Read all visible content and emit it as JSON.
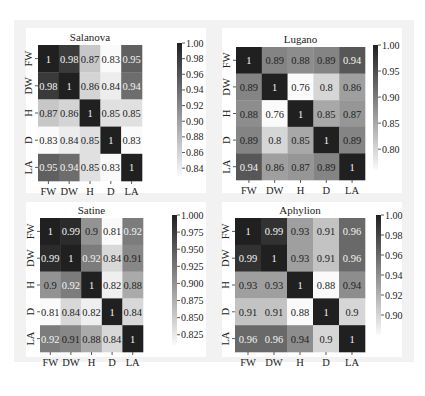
{
  "chart_data": [
    {
      "type": "heatmap",
      "title": "Salanova",
      "labels": [
        "FW",
        "DW",
        "H",
        "D",
        "LA"
      ],
      "values": [
        [
          1,
          0.98,
          0.87,
          0.83,
          0.95
        ],
        [
          0.98,
          1,
          0.86,
          0.84,
          0.94
        ],
        [
          0.87,
          0.86,
          1,
          0.85,
          0.85
        ],
        [
          0.83,
          0.84,
          0.85,
          1,
          0.83
        ],
        [
          0.95,
          0.94,
          0.85,
          0.83,
          1
        ]
      ],
      "cell_labels": [
        [
          "1",
          "0.98",
          "0.87",
          "0.83",
          "0.95"
        ],
        [
          "0.98",
          "1",
          "0.86",
          "0.84",
          "0.94"
        ],
        [
          "0.87",
          "0.86",
          "1",
          "0.85",
          "0.85"
        ],
        [
          "0.83",
          "0.84",
          "0.85",
          "1",
          "0.83"
        ],
        [
          "0.95",
          "0.94",
          "0.85",
          "0.83",
          "1"
        ]
      ],
      "colorbar": {
        "range": [
          0.83,
          1.0
        ],
        "ticks": [
          1.0,
          0.98,
          0.96,
          0.94,
          0.92,
          0.9,
          0.88,
          0.86,
          0.84
        ],
        "tick_labels": [
          "1.00",
          "0.98",
          "0.96",
          "0.94",
          "0.92",
          "0.90",
          "0.88",
          "0.86",
          "0.84"
        ]
      },
      "colormap": "grey (light = low, dark = high)"
    },
    {
      "type": "heatmap",
      "title": "Lugano",
      "labels": [
        "FW",
        "DW",
        "H",
        "D",
        "LA"
      ],
      "values": [
        [
          1,
          0.89,
          0.88,
          0.89,
          0.94
        ],
        [
          0.89,
          1,
          0.76,
          0.8,
          0.86
        ],
        [
          0.88,
          0.76,
          1,
          0.85,
          0.87
        ],
        [
          0.89,
          0.8,
          0.85,
          1,
          0.89
        ],
        [
          0.94,
          0.86,
          0.87,
          0.89,
          1
        ]
      ],
      "cell_labels": [
        [
          "1",
          "0.89",
          "0.88",
          "0.89",
          "0.94"
        ],
        [
          "0.89",
          "1",
          "0.76",
          "0.8",
          "0.86"
        ],
        [
          "0.88",
          "0.76",
          "1",
          "0.85",
          "0.87"
        ],
        [
          "0.89",
          "0.8",
          "0.85",
          "1",
          "0.89"
        ],
        [
          "0.94",
          "0.86",
          "0.87",
          "0.89",
          "1"
        ]
      ],
      "colorbar": {
        "range": [
          0.76,
          1.0
        ],
        "ticks": [
          1.0,
          0.95,
          0.9,
          0.85,
          0.8
        ],
        "tick_labels": [
          "1.00",
          "0.95",
          "0.90",
          "0.85",
          "0.80"
        ]
      },
      "colormap": "grey (light = low, dark = high)"
    },
    {
      "type": "heatmap",
      "title": "Satine",
      "labels": [
        "FW",
        "DW",
        "H",
        "D",
        "LA"
      ],
      "values": [
        [
          1,
          0.99,
          0.9,
          0.81,
          0.92
        ],
        [
          0.99,
          1,
          0.92,
          0.84,
          0.91
        ],
        [
          0.9,
          0.92,
          1,
          0.82,
          0.88
        ],
        [
          0.81,
          0.84,
          0.82,
          1,
          0.84
        ],
        [
          0.92,
          0.91,
          0.88,
          0.84,
          1
        ]
      ],
      "cell_labels": [
        [
          "1",
          "0.99",
          "0.9",
          "0.81",
          "0.92"
        ],
        [
          "0.99",
          "1",
          "0.92",
          "0.84",
          "0.91"
        ],
        [
          "0.9",
          "0.92",
          "1",
          "0.82",
          "0.88"
        ],
        [
          "0.81",
          "0.84",
          "0.82",
          "1",
          "0.84"
        ],
        [
          "0.92",
          "0.91",
          "0.88",
          "0.84",
          "1"
        ]
      ],
      "colorbar": {
        "range": [
          0.81,
          1.0
        ],
        "ticks": [
          1.0,
          0.975,
          0.95,
          0.925,
          0.9,
          0.875,
          0.85,
          0.825
        ],
        "tick_labels": [
          "1.000",
          "0.975",
          "0.950",
          "0.925",
          "0.900",
          "0.875",
          "0.850",
          "0.825"
        ]
      },
      "colormap": "grey (light = low, dark = high)"
    },
    {
      "type": "heatmap",
      "title": "Aphylion",
      "labels": [
        "FW",
        "DW",
        "H",
        "D",
        "LA"
      ],
      "values": [
        [
          1,
          0.99,
          0.93,
          0.91,
          0.96
        ],
        [
          0.99,
          1,
          0.93,
          0.91,
          0.96
        ],
        [
          0.93,
          0.93,
          1,
          0.88,
          0.94
        ],
        [
          0.91,
          0.91,
          0.88,
          1,
          0.9
        ],
        [
          0.96,
          0.96,
          0.94,
          0.9,
          1
        ]
      ],
      "cell_labels": [
        [
          "1",
          "0.99",
          "0.93",
          "0.91",
          "0.96"
        ],
        [
          "0.99",
          "1",
          "0.93",
          "0.91",
          "0.96"
        ],
        [
          "0.93",
          "0.93",
          "1",
          "0.88",
          "0.94"
        ],
        [
          "0.91",
          "0.91",
          "0.88",
          "1",
          "0.9"
        ],
        [
          "0.96",
          "0.96",
          "0.94",
          "0.9",
          "1"
        ]
      ],
      "colorbar": {
        "range": [
          0.88,
          1.0
        ],
        "ticks": [
          1.0,
          0.98,
          0.96,
          0.94,
          0.92,
          0.9
        ],
        "tick_labels": [
          "1.00",
          "0.98",
          "0.96",
          "0.94",
          "0.92",
          "0.90"
        ]
      },
      "colormap": "grey (light = low, dark = high)"
    }
  ]
}
